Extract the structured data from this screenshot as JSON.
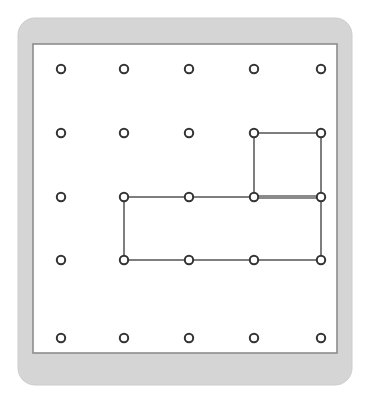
{
  "figure": {
    "name": "geoboard",
    "canvas": {
      "width": 369,
      "height": 399,
      "background": "#ffffff"
    }
  },
  "board": {
    "frame": {
      "x": 18,
      "y": 18,
      "width": 334,
      "height": 367,
      "corner_radius": 17,
      "fill": "#d5d5d5",
      "stroke": "#cccccc"
    },
    "panel": {
      "x": 33,
      "y": 44,
      "width": 304,
      "height": 309,
      "fill": "#ffffff",
      "stroke": "#8d8d8d",
      "stroke_width": 1.6
    }
  },
  "grid": {
    "rows": 5,
    "cols": 5,
    "col_x": [
      61,
      124,
      189,
      254,
      321
    ],
    "row_y": [
      69,
      133,
      197,
      260,
      338
    ],
    "peg": {
      "radius": 4.2,
      "inner_radius": 2.0,
      "fill": "#ffffff",
      "stroke": "#333333",
      "stroke_width": 2.0
    },
    "pegs": [
      {
        "id": "peg-r1-c1",
        "row": 1,
        "col": 1,
        "x": 61,
        "y": 69
      },
      {
        "id": "peg-r1-c2",
        "row": 1,
        "col": 2,
        "x": 124,
        "y": 69
      },
      {
        "id": "peg-r1-c3",
        "row": 1,
        "col": 3,
        "x": 189,
        "y": 69
      },
      {
        "id": "peg-r1-c4",
        "row": 1,
        "col": 4,
        "x": 254,
        "y": 69
      },
      {
        "id": "peg-r1-c5",
        "row": 1,
        "col": 5,
        "x": 321,
        "y": 69
      },
      {
        "id": "peg-r2-c1",
        "row": 2,
        "col": 1,
        "x": 61,
        "y": 133
      },
      {
        "id": "peg-r2-c2",
        "row": 2,
        "col": 2,
        "x": 124,
        "y": 133
      },
      {
        "id": "peg-r2-c3",
        "row": 2,
        "col": 3,
        "x": 189,
        "y": 133
      },
      {
        "id": "peg-r2-c4",
        "row": 2,
        "col": 4,
        "x": 254,
        "y": 133
      },
      {
        "id": "peg-r2-c5",
        "row": 2,
        "col": 5,
        "x": 321,
        "y": 133
      },
      {
        "id": "peg-r3-c1",
        "row": 3,
        "col": 1,
        "x": 61,
        "y": 197
      },
      {
        "id": "peg-r3-c2",
        "row": 3,
        "col": 2,
        "x": 124,
        "y": 197
      },
      {
        "id": "peg-r3-c3",
        "row": 3,
        "col": 3,
        "x": 189,
        "y": 197
      },
      {
        "id": "peg-r3-c4",
        "row": 3,
        "col": 4,
        "x": 254,
        "y": 197
      },
      {
        "id": "peg-r3-c5",
        "row": 3,
        "col": 5,
        "x": 321,
        "y": 197
      },
      {
        "id": "peg-r4-c1",
        "row": 4,
        "col": 1,
        "x": 61,
        "y": 260
      },
      {
        "id": "peg-r4-c2",
        "row": 4,
        "col": 2,
        "x": 124,
        "y": 260
      },
      {
        "id": "peg-r4-c3",
        "row": 4,
        "col": 3,
        "x": 189,
        "y": 260
      },
      {
        "id": "peg-r4-c4",
        "row": 4,
        "col": 4,
        "x": 254,
        "y": 260
      },
      {
        "id": "peg-r4-c5",
        "row": 4,
        "col": 5,
        "x": 321,
        "y": 260
      },
      {
        "id": "peg-r5-c1",
        "row": 5,
        "col": 1,
        "x": 61,
        "y": 338
      },
      {
        "id": "peg-r5-c2",
        "row": 5,
        "col": 2,
        "x": 124,
        "y": 338
      },
      {
        "id": "peg-r5-c3",
        "row": 5,
        "col": 3,
        "x": 189,
        "y": 338
      },
      {
        "id": "peg-r5-c4",
        "row": 5,
        "col": 4,
        "x": 254,
        "y": 338
      },
      {
        "id": "peg-r5-c5",
        "row": 5,
        "col": 5,
        "x": 321,
        "y": 338
      }
    ]
  },
  "shapes": [
    {
      "id": "shape-square",
      "name": "rubber-band-square",
      "kind": "square",
      "stroke": "#7e7e7e",
      "stroke_width": 2.0,
      "fill": "none",
      "vertices_rc": [
        [
          2,
          4
        ],
        [
          2,
          5
        ],
        [
          3,
          5
        ],
        [
          3,
          4
        ]
      ],
      "points": "254,133 321,133 321,197 254,197"
    },
    {
      "id": "shape-rectangle",
      "name": "rubber-band-rectangle",
      "kind": "rectangle",
      "stroke": "#7e7e7e",
      "stroke_width": 2.0,
      "fill": "none",
      "vertices_rc": [
        [
          3,
          2
        ],
        [
          3,
          5
        ],
        [
          4,
          5
        ],
        [
          4,
          2
        ]
      ],
      "points": "124,197 321,197 321,260 124,260"
    }
  ],
  "overlap_segment": {
    "id": "segment-shared-edge",
    "name": "shared-edge-row3-col4-to-col5",
    "x1": 254,
    "y1": 197,
    "x2": 321,
    "y2": 197,
    "stroke": "#8a8a8a",
    "stroke_width": 4.0
  }
}
